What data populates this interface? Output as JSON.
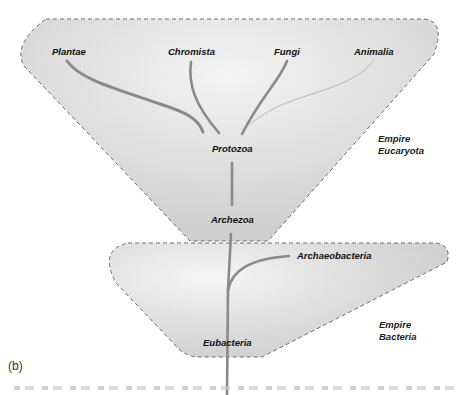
{
  "figure": {
    "panel_label": "(b)",
    "empires": [
      {
        "id": "eucaryota",
        "line1": "Empire",
        "line2": "Eucaryota"
      },
      {
        "id": "bacteria",
        "line1": "Empire",
        "line2": "Bacteria"
      }
    ],
    "taxa": {
      "plantae": "Plantae",
      "chromista": "Chromista",
      "fungi": "Fungi",
      "animalia": "Animalia",
      "protozoa": "Protozoa",
      "archezoa": "Archezoa",
      "archaeobacteria": "Archaeobacteria",
      "eubacteria": "Eubacteria"
    },
    "colors": {
      "region_fill": "#dcdcdc",
      "region_border": "#6e6e6e",
      "branch": "#8a8a8a"
    }
  }
}
